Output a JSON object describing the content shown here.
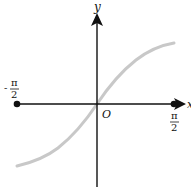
{
  "figure": {
    "type": "function-graph",
    "function": "y = sin x",
    "domain": [
      "-π/2",
      "π/2"
    ],
    "axes": {
      "x_label": "x",
      "y_label": "y",
      "origin_label": "O"
    },
    "ticks": {
      "left": {
        "numerator": "π",
        "denominator": "2",
        "sign": "-"
      },
      "right": {
        "numerator": "π",
        "denominator": "2",
        "sign": ""
      }
    },
    "colors": {
      "axis": "#111111",
      "curve": "#c8c8c8",
      "background": "#ffffff"
    }
  }
}
